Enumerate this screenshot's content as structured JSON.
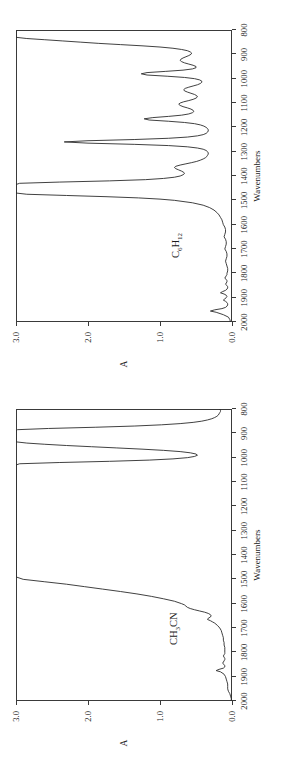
{
  "figure": {
    "orientation": "rotated-90-ccw",
    "background": "#ffffff",
    "line_color": "#2b2b2b",
    "axis_color": "#3a3a3a",
    "panels": [
      "panel_top",
      "panel_bottom"
    ]
  },
  "chart_data": [
    {
      "id": "panel_top",
      "type": "line",
      "title": "C6H12",
      "title_html": "C<sub>6</sub>H<sub>12</sub>",
      "annotation": "C6H12",
      "xlabel": "Wavenumbers",
      "ylabel": "A",
      "xlim": [
        2000,
        800
      ],
      "ylim": [
        0.0,
        3.0
      ],
      "xticks": [
        2000,
        1900,
        1800,
        1700,
        1600,
        1500,
        1400,
        1300,
        1200,
        1100,
        1000,
        900,
        800
      ],
      "xticklabels": [
        "2000",
        "1900",
        "1800",
        "1700",
        "1600",
        "1500",
        "1400",
        "1300",
        "1200",
        "1100",
        "1000",
        "900",
        "800"
      ],
      "yticks": [
        0.0,
        1.0,
        2.0,
        3.0
      ],
      "yticklabels": [
        "0.0",
        "1.0",
        "2.0",
        "3.0"
      ],
      "grid": false,
      "legend": "none",
      "x": [
        2000,
        1990,
        1980,
        1970,
        1960,
        1955,
        1950,
        1945,
        1940,
        1935,
        1930,
        1925,
        1920,
        1915,
        1910,
        1905,
        1900,
        1895,
        1890,
        1885,
        1880,
        1875,
        1870,
        1865,
        1860,
        1855,
        1850,
        1845,
        1840,
        1835,
        1830,
        1825,
        1820,
        1815,
        1810,
        1805,
        1800,
        1790,
        1780,
        1770,
        1760,
        1750,
        1740,
        1730,
        1720,
        1710,
        1700,
        1690,
        1680,
        1670,
        1660,
        1650,
        1640,
        1630,
        1620,
        1610,
        1600,
        1590,
        1580,
        1570,
        1560,
        1550,
        1540,
        1530,
        1520,
        1510,
        1500,
        1495,
        1490,
        1485,
        1480,
        1475,
        1470,
        1465,
        1460,
        1455,
        1450,
        1445,
        1440,
        1435,
        1430,
        1425,
        1420,
        1415,
        1410,
        1405,
        1400,
        1395,
        1390,
        1385,
        1380,
        1375,
        1370,
        1365,
        1360,
        1355,
        1350,
        1345,
        1340,
        1335,
        1330,
        1325,
        1320,
        1315,
        1310,
        1305,
        1300,
        1295,
        1290,
        1285,
        1280,
        1275,
        1270,
        1265,
        1260,
        1255,
        1250,
        1245,
        1240,
        1235,
        1230,
        1225,
        1220,
        1215,
        1210,
        1205,
        1200,
        1195,
        1190,
        1185,
        1180,
        1175,
        1170,
        1165,
        1160,
        1155,
        1150,
        1145,
        1140,
        1135,
        1130,
        1125,
        1120,
        1115,
        1110,
        1105,
        1100,
        1095,
        1090,
        1085,
        1080,
        1075,
        1070,
        1065,
        1060,
        1055,
        1050,
        1045,
        1040,
        1035,
        1030,
        1025,
        1020,
        1015,
        1010,
        1005,
        1000,
        995,
        990,
        985,
        980,
        975,
        970,
        965,
        960,
        955,
        950,
        945,
        940,
        935,
        930,
        925,
        920,
        915,
        910,
        905,
        900,
        895,
        890,
        885,
        880,
        875,
        870,
        865,
        860,
        855,
        850,
        845,
        840,
        835,
        830,
        825,
        820,
        815,
        810,
        805,
        800
      ],
      "y": [
        0.02,
        0.03,
        0.05,
        0.12,
        0.22,
        0.3,
        0.24,
        0.14,
        0.09,
        0.07,
        0.06,
        0.06,
        0.07,
        0.09,
        0.12,
        0.1,
        0.08,
        0.07,
        0.08,
        0.11,
        0.16,
        0.13,
        0.09,
        0.07,
        0.06,
        0.06,
        0.07,
        0.09,
        0.08,
        0.07,
        0.07,
        0.08,
        0.1,
        0.09,
        0.08,
        0.07,
        0.07,
        0.06,
        0.06,
        0.07,
        0.08,
        0.09,
        0.08,
        0.07,
        0.07,
        0.08,
        0.1,
        0.09,
        0.08,
        0.08,
        0.09,
        0.11,
        0.1,
        0.09,
        0.09,
        0.1,
        0.12,
        0.13,
        0.14,
        0.16,
        0.18,
        0.21,
        0.25,
        0.31,
        0.4,
        0.55,
        0.8,
        1.0,
        1.3,
        1.75,
        2.3,
        2.85,
        3.0,
        3.0,
        3.0,
        3.0,
        3.0,
        3.0,
        3.0,
        3.0,
        2.95,
        2.4,
        1.7,
        1.2,
        0.95,
        0.8,
        0.72,
        0.68,
        0.66,
        0.67,
        0.7,
        0.74,
        0.78,
        0.8,
        0.78,
        0.72,
        0.64,
        0.56,
        0.49,
        0.44,
        0.4,
        0.37,
        0.35,
        0.34,
        0.33,
        0.33,
        0.34,
        0.36,
        0.4,
        0.48,
        0.62,
        0.88,
        1.35,
        2.0,
        2.33,
        2.0,
        1.35,
        0.88,
        0.62,
        0.48,
        0.4,
        0.36,
        0.34,
        0.33,
        0.33,
        0.34,
        0.36,
        0.39,
        0.44,
        0.52,
        0.66,
        0.88,
        1.15,
        1.22,
        1.1,
        0.88,
        0.7,
        0.6,
        0.55,
        0.53,
        0.54,
        0.57,
        0.62,
        0.68,
        0.72,
        0.74,
        0.72,
        0.67,
        0.6,
        0.54,
        0.5,
        0.48,
        0.49,
        0.52,
        0.57,
        0.62,
        0.66,
        0.67,
        0.65,
        0.6,
        0.54,
        0.48,
        0.44,
        0.42,
        0.42,
        0.45,
        0.52,
        0.66,
        0.9,
        1.18,
        1.26,
        1.18,
        0.92,
        0.68,
        0.55,
        0.5,
        0.5,
        0.54,
        0.6,
        0.66,
        0.7,
        0.72,
        0.71,
        0.68,
        0.64,
        0.6,
        0.57,
        0.56,
        0.58,
        0.62,
        0.7,
        0.82,
        1.0,
        1.25,
        1.55,
        1.85,
        2.1,
        2.35,
        2.6,
        2.85,
        3.0,
        3.0,
        3.0,
        3.0,
        3.0,
        3.0,
        3.0,
        2.95,
        2.55,
        2.0,
        1.55,
        1.25,
        1.05,
        0.92,
        0.84,
        0.78,
        0.73,
        0.68,
        0.62,
        0.56,
        0.49,
        0.42,
        0.35,
        0.29,
        0.24,
        0.2,
        0.17,
        0.15,
        0.13,
        0.12,
        0.11,
        0.1,
        0.1,
        0.09
      ]
    },
    {
      "id": "panel_bottom",
      "type": "line",
      "title": "CH3CN",
      "title_html": "CH<sub>3</sub>CN",
      "annotation": "CH3CN",
      "xlabel": "Wavenumbers",
      "ylabel": "A",
      "xlim": [
        2000,
        800
      ],
      "ylim": [
        0.0,
        3.0
      ],
      "xticks": [
        2000,
        1900,
        1800,
        1700,
        1600,
        1500,
        1400,
        1300,
        1200,
        1100,
        1000,
        900,
        800
      ],
      "xticklabels": [
        "2000",
        "1900",
        "1800",
        "1700",
        "1600",
        "1500",
        "1400",
        "1300",
        "1200",
        "1100",
        "1000",
        "900",
        "800"
      ],
      "yticks": [
        0.0,
        1.0,
        2.0,
        3.0
      ],
      "yticklabels": [
        "0.0",
        "1.0",
        "2.0",
        "3.0"
      ],
      "grid": false,
      "legend": "none",
      "x": [
        2000,
        1990,
        1980,
        1970,
        1960,
        1950,
        1940,
        1930,
        1920,
        1910,
        1900,
        1890,
        1880,
        1875,
        1870,
        1865,
        1860,
        1855,
        1850,
        1845,
        1840,
        1835,
        1830,
        1825,
        1820,
        1815,
        1810,
        1805,
        1800,
        1790,
        1780,
        1770,
        1760,
        1750,
        1740,
        1730,
        1720,
        1710,
        1700,
        1690,
        1680,
        1675,
        1670,
        1665,
        1660,
        1655,
        1650,
        1645,
        1640,
        1635,
        1630,
        1625,
        1620,
        1615,
        1610,
        1605,
        1600,
        1590,
        1580,
        1570,
        1560,
        1550,
        1540,
        1530,
        1520,
        1510,
        1500,
        1490,
        1480,
        1470,
        1460,
        1450,
        1440,
        1430,
        1420,
        1410,
        1400,
        1390,
        1380,
        1375,
        1370,
        1360,
        1350,
        1340,
        1330,
        1320,
        1310,
        1300,
        1290,
        1280,
        1270,
        1260,
        1250,
        1240,
        1230,
        1220,
        1210,
        1200,
        1190,
        1180,
        1170,
        1160,
        1150,
        1140,
        1130,
        1120,
        1110,
        1100,
        1090,
        1080,
        1070,
        1060,
        1050,
        1040,
        1035,
        1030,
        1025,
        1020,
        1015,
        1010,
        1005,
        1000,
        995,
        990,
        985,
        980,
        975,
        970,
        965,
        960,
        955,
        950,
        945,
        940,
        935,
        930,
        925,
        920,
        915,
        910,
        905,
        900,
        895,
        890,
        885,
        880,
        875,
        870,
        865,
        860,
        855,
        850,
        845,
        840,
        835,
        830,
        825,
        820,
        815,
        810,
        805,
        800
      ],
      "y": [
        0.01,
        0.01,
        0.02,
        0.03,
        0.05,
        0.06,
        0.06,
        0.06,
        0.07,
        0.08,
        0.09,
        0.11,
        0.16,
        0.22,
        0.18,
        0.12,
        0.1,
        0.1,
        0.11,
        0.13,
        0.12,
        0.11,
        0.1,
        0.1,
        0.11,
        0.12,
        0.11,
        0.1,
        0.1,
        0.1,
        0.1,
        0.11,
        0.11,
        0.12,
        0.12,
        0.13,
        0.14,
        0.15,
        0.17,
        0.2,
        0.24,
        0.27,
        0.3,
        0.34,
        0.33,
        0.3,
        0.29,
        0.3,
        0.33,
        0.38,
        0.45,
        0.52,
        0.58,
        0.62,
        0.64,
        0.66,
        0.7,
        0.8,
        0.95,
        1.12,
        1.32,
        1.55,
        1.8,
        2.05,
        2.3,
        2.6,
        2.9,
        3.0,
        3.0,
        3.0,
        3.0,
        3.0,
        3.0,
        3.0,
        3.0,
        3.0,
        3.0,
        3.0,
        3.0,
        3.0,
        3.0,
        3.0,
        3.0,
        3.0,
        3.0,
        3.0,
        3.0,
        3.0,
        3.0,
        3.0,
        3.0,
        3.0,
        3.0,
        3.0,
        3.0,
        3.0,
        3.0,
        3.0,
        3.0,
        3.0,
        3.0,
        3.0,
        3.0,
        3.0,
        3.0,
        3.0,
        3.0,
        3.0,
        3.0,
        3.0,
        3.0,
        3.0,
        3.0,
        3.0,
        3.0,
        3.0,
        2.95,
        2.4,
        1.7,
        1.15,
        0.82,
        0.62,
        0.52,
        0.48,
        0.5,
        0.58,
        0.72,
        0.95,
        1.25,
        1.6,
        1.95,
        2.3,
        2.6,
        2.85,
        3.0,
        3.0,
        3.0,
        3.0,
        3.0,
        3.0,
        3.0,
        3.0,
        3.0,
        3.0,
        2.98,
        2.55,
        1.9,
        1.35,
        0.98,
        0.72,
        0.54,
        0.42,
        0.34,
        0.28,
        0.24,
        0.21,
        0.19,
        0.18,
        0.17,
        0.16,
        0.16,
        0.17,
        0.16,
        0.15,
        0.15,
        0.14,
        0.14,
        0.13,
        0.13
      ]
    }
  ]
}
